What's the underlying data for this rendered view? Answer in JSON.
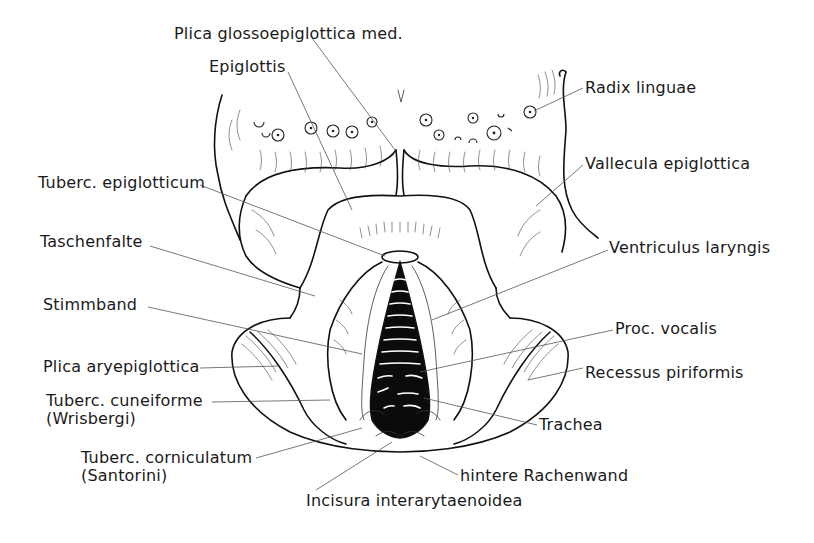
{
  "figure": {
    "labels": [
      {
        "id": "plica-glossoepiglottica-med",
        "text": "Plica glossoepiglottica med.",
        "x": 174,
        "y": 25
      },
      {
        "id": "epiglottis",
        "text": "Epiglottis",
        "x": 209,
        "y": 58
      },
      {
        "id": "radix-linguae",
        "text": "Radix linguae",
        "x": 585,
        "y": 79
      },
      {
        "id": "vallecula-epiglottica",
        "text": "Vallecula epiglottica",
        "x": 585,
        "y": 155
      },
      {
        "id": "tuberc-epiglotticum",
        "text": "Tuberc. epiglotticum",
        "x": 38,
        "y": 174
      },
      {
        "id": "taschenfalte",
        "text": "Taschenfalte",
        "x": 40,
        "y": 233
      },
      {
        "id": "ventriculus-laryngis",
        "text": "Ventriculus laryngis",
        "x": 609,
        "y": 239
      },
      {
        "id": "stimmband",
        "text": "Stimmband",
        "x": 43,
        "y": 296
      },
      {
        "id": "proc-vocalis",
        "text": "Proc. vocalis",
        "x": 615,
        "y": 320
      },
      {
        "id": "plica-aryepiglottica",
        "text": "Plica aryepiglottica",
        "x": 43,
        "y": 358
      },
      {
        "id": "recessus-piriformis",
        "text": "Recessus piriformis",
        "x": 585,
        "y": 364
      },
      {
        "id": "tuberc-cuneiforme",
        "text": "Tuberc. cuneiforme\n(Wrisbergi)",
        "x": 46,
        "y": 392
      },
      {
        "id": "trachea",
        "text": "Trachea",
        "x": 539,
        "y": 416
      },
      {
        "id": "tuberc-corniculatum",
        "text": "Tuberc. corniculatum\n(Santorini)",
        "x": 81,
        "y": 449
      },
      {
        "id": "hintere-rachenwand",
        "text": "hintere Rachenwand",
        "x": 460,
        "y": 467
      },
      {
        "id": "incisura-interarytaenoidea",
        "text": "Incisura interarytaenoidea",
        "x": 306,
        "y": 492
      }
    ],
    "colors": {
      "ink": "#111111",
      "background": "#ffffff",
      "leader": "#555555"
    }
  }
}
